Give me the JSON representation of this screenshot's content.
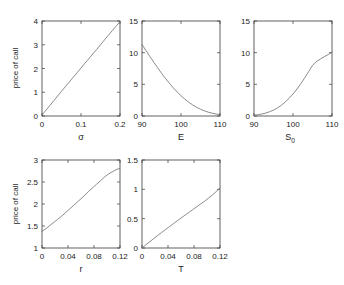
{
  "figure": {
    "background_color": "#ffffff",
    "axis_color": "#3a3a3a",
    "line_color": "#6d6d6d",
    "layout": "2 rows x 3 columns, sixth cell empty"
  },
  "chart_data": [
    {
      "type": "line",
      "title": "",
      "xlabel": "σ",
      "ylabel": "price of call",
      "xlim": [
        0,
        0.2
      ],
      "ylim": [
        0,
        4
      ],
      "xticks": [
        0,
        0.1,
        0.2
      ],
      "xticklabels": [
        "0",
        "0.1",
        "0.2"
      ],
      "yticks": [
        0,
        1,
        2,
        3,
        4
      ],
      "yticklabels": [
        "0",
        "1",
        "2",
        "3",
        "4"
      ],
      "grid": false,
      "legend": "none",
      "x": [
        0,
        0.01,
        0.02,
        0.03,
        0.04,
        0.05,
        0.06,
        0.07,
        0.08,
        0.09,
        0.1,
        0.11,
        0.12,
        0.13,
        0.14,
        0.15,
        0.16,
        0.17,
        0.18,
        0.19,
        0.2
      ],
      "values": [
        0.04,
        0.24,
        0.44,
        0.64,
        0.84,
        1.04,
        1.24,
        1.43,
        1.63,
        1.82,
        2.02,
        2.22,
        2.41,
        2.61,
        2.8,
        3.0,
        3.2,
        3.4,
        3.59,
        3.78,
        3.97
      ]
    },
    {
      "type": "line",
      "title": "",
      "xlabel": "E",
      "ylabel": "",
      "xlim": [
        90,
        110
      ],
      "ylim": [
        0,
        15
      ],
      "xticks": [
        90,
        100,
        110
      ],
      "xticklabels": [
        "90",
        "100",
        "110"
      ],
      "yticks": [
        0,
        5,
        10,
        15
      ],
      "yticklabels": [
        "0",
        "5",
        "10",
        "15"
      ],
      "grid": false,
      "legend": "none",
      "x": [
        90,
        91,
        92,
        93,
        94,
        95,
        96,
        97,
        98,
        99,
        100,
        101,
        102,
        103,
        104,
        105,
        106,
        107,
        108,
        109,
        110
      ],
      "values": [
        11.3,
        10.35,
        9.42,
        8.5,
        7.62,
        6.76,
        5.95,
        5.18,
        4.46,
        3.8,
        3.2,
        2.65,
        2.17,
        1.74,
        1.38,
        1.07,
        0.81,
        0.6,
        0.44,
        0.31,
        0.22
      ]
    },
    {
      "type": "line",
      "title": "",
      "xlabel": "S_0",
      "xlabel_base": "S",
      "xlabel_sub": "0",
      "ylabel": "",
      "xlim": [
        90,
        110
      ],
      "ylim": [
        0,
        15
      ],
      "xticks": [
        90,
        100,
        110
      ],
      "xticklabels": [
        "90",
        "100",
        "110"
      ],
      "yticks": [
        0,
        5,
        10,
        15
      ],
      "yticklabels": [
        "0",
        "5",
        "10",
        "15"
      ],
      "grid": false,
      "legend": "none",
      "x": [
        90,
        91,
        92,
        93,
        94,
        95,
        96,
        97,
        98,
        99,
        100,
        101,
        102,
        103,
        104,
        105,
        106,
        107,
        108,
        109,
        110
      ],
      "values": [
        0.12,
        0.2,
        0.31,
        0.46,
        0.67,
        0.94,
        1.28,
        1.7,
        2.2,
        2.8,
        3.48,
        4.25,
        5.1,
        6.02,
        7.0,
        8.0,
        8.6,
        9.0,
        9.35,
        9.7,
        10.05
      ]
    },
    {
      "type": "line",
      "title": "",
      "xlabel": "r",
      "ylabel": "price of call",
      "xlim": [
        0,
        0.12
      ],
      "ylim": [
        1,
        3
      ],
      "xticks": [
        0,
        0.04,
        0.08,
        0.12
      ],
      "xticklabels": [
        "0",
        "0.04",
        "0.08",
        "0.12"
      ],
      "yticks": [
        1,
        1.5,
        2,
        2.5,
        3
      ],
      "yticklabels": [
        "1",
        "1.5",
        "2",
        "2.5",
        "3"
      ],
      "grid": false,
      "legend": "none",
      "x": [
        0,
        0.006,
        0.012,
        0.018,
        0.024,
        0.03,
        0.036,
        0.042,
        0.048,
        0.054,
        0.06,
        0.066,
        0.072,
        0.078,
        0.084,
        0.09,
        0.096,
        0.102,
        0.108,
        0.114,
        0.12
      ],
      "values": [
        1.38,
        1.44,
        1.51,
        1.58,
        1.65,
        1.72,
        1.8,
        1.88,
        1.96,
        2.04,
        2.12,
        2.2,
        2.29,
        2.37,
        2.45,
        2.53,
        2.61,
        2.68,
        2.73,
        2.78,
        2.81
      ]
    },
    {
      "type": "line",
      "title": "",
      "xlabel": "T",
      "ylabel": "price of call",
      "xlim": [
        0,
        0.12
      ],
      "ylim": [
        0,
        1.5
      ],
      "xticks": [
        0,
        0.04,
        0.08,
        0.12
      ],
      "xticklabels": [
        "0",
        "0.04",
        "0.08",
        "0.12"
      ],
      "yticks": [
        0,
        0.5,
        1,
        1.5
      ],
      "yticklabels": [
        "0",
        "0.5",
        "1",
        "1.5"
      ],
      "grid": false,
      "legend": "none",
      "x": [
        0,
        0.006,
        0.012,
        0.018,
        0.024,
        0.03,
        0.036,
        0.042,
        0.048,
        0.054,
        0.06,
        0.066,
        0.072,
        0.078,
        0.084,
        0.09,
        0.096,
        0.102,
        0.108,
        0.114,
        0.12
      ],
      "values": [
        0.0,
        0.055,
        0.108,
        0.16,
        0.212,
        0.263,
        0.313,
        0.363,
        0.412,
        0.461,
        0.51,
        0.558,
        0.606,
        0.654,
        0.701,
        0.748,
        0.795,
        0.848,
        0.9,
        0.96,
        1.02
      ]
    }
  ]
}
